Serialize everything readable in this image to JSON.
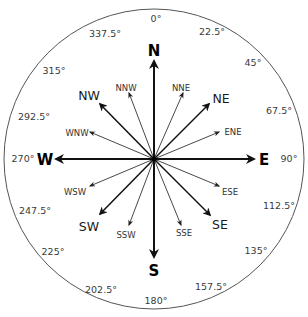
{
  "diagram": {
    "center": {
      "x": 154,
      "y": 159
    },
    "radius": 150,
    "colors": {
      "circle": "#555555",
      "arrow": "#111111",
      "text": "#222222"
    },
    "cardinal": [
      {
        "label": "N",
        "angle": 0
      },
      {
        "label": "E",
        "angle": 90
      },
      {
        "label": "S",
        "angle": 180
      },
      {
        "label": "W",
        "angle": 270
      }
    ],
    "intercardinal": [
      {
        "label": "NE",
        "angle": 45
      },
      {
        "label": "SE",
        "angle": 135
      },
      {
        "label": "SW",
        "angle": 225
      },
      {
        "label": "NW",
        "angle": 315
      }
    ],
    "secondary": [
      {
        "label": "NNE",
        "angle": 22.5
      },
      {
        "label": "ENE",
        "angle": 67.5
      },
      {
        "label": "ESE",
        "angle": 112.5
      },
      {
        "label": "SSE",
        "angle": 157.5
      },
      {
        "label": "SSW",
        "angle": 202.5
      },
      {
        "label": "WSW",
        "angle": 247.5
      },
      {
        "label": "WNW",
        "angle": 292.5
      },
      {
        "label": "NNW",
        "angle": 337.5
      }
    ],
    "degree_labels": [
      {
        "text": "0°",
        "angle": 0
      },
      {
        "text": "22.5°",
        "angle": 22.5
      },
      {
        "text": "45°",
        "angle": 45
      },
      {
        "text": "67.5°",
        "angle": 67.5
      },
      {
        "text": "90°",
        "angle": 90
      },
      {
        "text": "112.5°",
        "angle": 112.5
      },
      {
        "text": "135°",
        "angle": 135
      },
      {
        "text": "157.5°",
        "angle": 157.5
      },
      {
        "text": "180°",
        "angle": 180
      },
      {
        "text": "202.5°",
        "angle": 202.5
      },
      {
        "text": "225°",
        "angle": 225
      },
      {
        "text": "247.5°",
        "angle": 247.5
      },
      {
        "text": "270°",
        "angle": 270
      },
      {
        "text": "292.5°",
        "angle": 292.5
      },
      {
        "text": "315°",
        "angle": 315
      },
      {
        "text": "337.5°",
        "angle": 337.5
      }
    ]
  }
}
